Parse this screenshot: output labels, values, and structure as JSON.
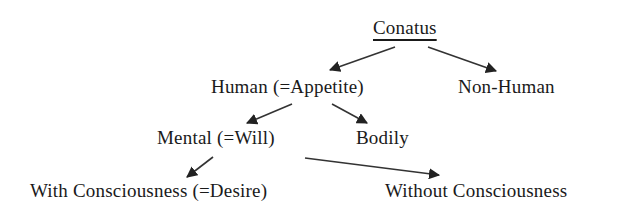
{
  "diagram": {
    "type": "tree",
    "root": {
      "label": "Conatus",
      "underlined": true
    },
    "nodes": {
      "conatus": "Conatus",
      "human": "Human (=Appetite)",
      "non_human": "Non-Human",
      "mental": "Mental (=Will)",
      "bodily": "Bodily",
      "with_consciousness": "With Consciousness (=Desire)",
      "without_consciousness": "Without Consciousness"
    },
    "edges": [
      {
        "from": "Conatus",
        "to": "Human (=Appetite)"
      },
      {
        "from": "Conatus",
        "to": "Non-Human"
      },
      {
        "from": "Human (=Appetite)",
        "to": "Mental (=Will)"
      },
      {
        "from": "Human (=Appetite)",
        "to": "Bodily"
      },
      {
        "from": "Mental (=Will)",
        "to": "With Consciousness (=Desire)"
      },
      {
        "from": "Mental (=Will)",
        "to": "Without Consciousness"
      }
    ],
    "colors": {
      "text": "#1a1a1a",
      "arrow": "#222222",
      "background": "#ffffff"
    }
  }
}
